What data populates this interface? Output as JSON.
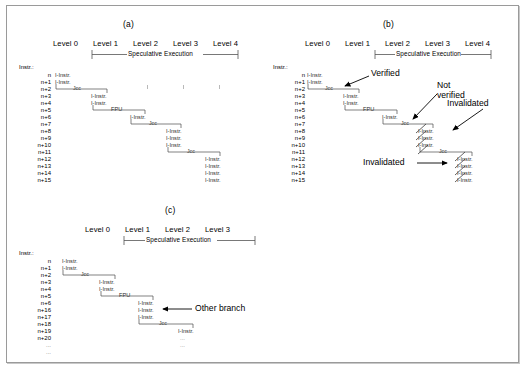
{
  "figure": {
    "caption_a": "(a)",
    "caption_b": "(b)",
    "caption_c": "(c)",
    "instr_header": "Instr.:",
    "spec_exec_label": "Speculative Execution",
    "instr_text": "I-Instr.",
    "jcc_text": "Jcc",
    "fpu_text": "FPU",
    "ellipsis": "..."
  },
  "panel_a": {
    "id": "(a)",
    "levels": [
      "Level 0",
      "Level 1",
      "Level 2",
      "Level 3",
      "Level 4"
    ],
    "spec_exec": "Speculative Execution",
    "spec_from_level": 1,
    "spec_to_level": 4,
    "rows": [
      "n",
      "n+1",
      "n+2",
      "n+3",
      "n+4",
      "n+5",
      "n+6",
      "n+7",
      "n+8",
      "n+9",
      "n+10",
      "n+11",
      "n+12",
      "n+13",
      "n+14",
      "n+15"
    ],
    "groups": [
      {
        "level": 0,
        "rows": [
          "n",
          "n+1"
        ],
        "labels": [
          "I-Instr.",
          "I-Instr."
        ],
        "branch": "Jcc",
        "branch_row": "n+2"
      },
      {
        "level": 1,
        "rows": [
          "n+3",
          "n+4"
        ],
        "labels": [
          "I-Instr.",
          "I-Instr."
        ],
        "branch": "FPU",
        "branch_row": "n+5"
      },
      {
        "level": 2,
        "rows": [
          "n+6"
        ],
        "labels": [
          "I-Instr."
        ],
        "branch": "Jcc",
        "branch_row": "n+7"
      },
      {
        "level": 3,
        "rows": [
          "n+8",
          "n+9",
          "n+10"
        ],
        "labels": [
          "I-Instr.",
          "I-Instr.",
          "I-Instr."
        ],
        "branch": "Jcc",
        "branch_row": "n+11"
      },
      {
        "level": 4,
        "rows": [
          "n+12",
          "n+13",
          "n+14",
          "n+15"
        ],
        "labels": [
          "I-Instr.",
          "I-Instr.",
          "I-Instr.",
          "I-Instr."
        ],
        "branch": null,
        "branch_row": null
      }
    ]
  },
  "panel_b": {
    "id": "(b)",
    "levels": [
      "Level 0",
      "Level 1",
      "Level 2",
      "Level 3",
      "Level 4"
    ],
    "spec_exec": "Speculative Execution",
    "spec_from_level": 1,
    "spec_to_level": 4,
    "rows": [
      "n",
      "n+1",
      "n+2",
      "n+3",
      "n+4",
      "n+5",
      "n+6",
      "n+7",
      "n+8",
      "n+9",
      "n+10",
      "n+11",
      "n+12",
      "n+13",
      "n+14",
      "n+15"
    ],
    "groups": [
      {
        "level": 0,
        "rows": [
          "n",
          "n+1"
        ],
        "labels": [
          "I-Instr.",
          "I-Instr."
        ],
        "branch": "Jcc",
        "branch_row": "n+2",
        "invalidated": false
      },
      {
        "level": 1,
        "rows": [
          "n+3",
          "n+4"
        ],
        "labels": [
          "I-Instr.",
          "I-Instr."
        ],
        "branch": "FPU",
        "branch_row": "n+5",
        "invalidated": false
      },
      {
        "level": 2,
        "rows": [
          "n+6"
        ],
        "labels": [
          "I-Instr."
        ],
        "branch": "Jcc",
        "branch_row": "n+7",
        "invalidated": false
      },
      {
        "level": 3,
        "rows": [
          "n+8",
          "n+9",
          "n+10"
        ],
        "labels": [
          "I-Instr.",
          "I-Instr.",
          "I-Instr."
        ],
        "branch": "Jcc",
        "branch_row": "n+11",
        "invalidated": true
      },
      {
        "level": 4,
        "rows": [
          "n+12",
          "n+13",
          "n+14",
          "n+15"
        ],
        "labels": [
          "I-Instr.",
          "I-Instr.",
          "I-Instr.",
          "I-Instr."
        ],
        "branch": null,
        "branch_row": null,
        "invalidated": true
      }
    ],
    "annotations": [
      {
        "text": "Verified",
        "target": "level-0-jcc"
      },
      {
        "text_line1": "Not",
        "text_line2": "verified",
        "target": "level-2-jcc"
      },
      {
        "text": "Invalidated",
        "target": "level-3-instructions"
      },
      {
        "text": "Invalidated",
        "target": "level-4-instructions"
      }
    ]
  },
  "panel_c": {
    "id": "(c)",
    "levels": [
      "Level 0",
      "Level 1",
      "Level 2",
      "Level 3"
    ],
    "spec_exec": "Speculative Execution",
    "spec_from_level": 1,
    "spec_to_level": 3,
    "rows": [
      "n",
      "n+1",
      "n+2",
      "n+3",
      "n+4",
      "n+5",
      "n+6",
      "n+16",
      "n+17",
      "n+18",
      "n+19",
      "n+20",
      "...",
      "..."
    ],
    "groups": [
      {
        "level": 0,
        "rows": [
          "n",
          "n+1"
        ],
        "labels": [
          "I-Instr.",
          "I-Instr."
        ],
        "branch": "Jcc",
        "branch_row": "n+2"
      },
      {
        "level": 1,
        "rows": [
          "n+3",
          "n+4"
        ],
        "labels": [
          "I-Instr.",
          "I-Instr."
        ],
        "branch": "FPU",
        "branch_row": "n+5"
      },
      {
        "level": 2,
        "rows": [
          "n+6",
          "n+16",
          "n+17"
        ],
        "labels": [
          "I-Instr.",
          "I-Instr.",
          "I-Instr."
        ],
        "branch": "Jcc",
        "branch_row": "n+18"
      },
      {
        "level": 3,
        "rows": [
          "n+19"
        ],
        "labels": [
          "I-Instr."
        ],
        "branch": null,
        "branch_row": null
      }
    ],
    "annotations": [
      {
        "text": "Other branch",
        "target": "level-2-instructions"
      }
    ]
  }
}
